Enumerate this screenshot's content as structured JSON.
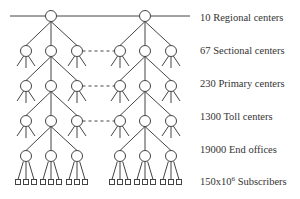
{
  "diagram": {
    "levels": [
      {
        "count": "10",
        "name": "Regional centers",
        "label": "10 Regional centers"
      },
      {
        "count": "67",
        "name": "Sectional centers",
        "label": "67 Sectional centers"
      },
      {
        "count": "230",
        "name": "Primary centers",
        "label": "230 Primary centers"
      },
      {
        "count": "1300",
        "name": "Toll centers",
        "label": "1300 Toll centers"
      },
      {
        "count": "19000",
        "name": "End offices",
        "label": "19000 End offices"
      },
      {
        "count_base": "150x10",
        "count_exp": "6",
        "name": "Subscribers"
      }
    ],
    "colors": {
      "stroke": "#444444",
      "text": "#333333",
      "background": "#ffffff"
    }
  }
}
